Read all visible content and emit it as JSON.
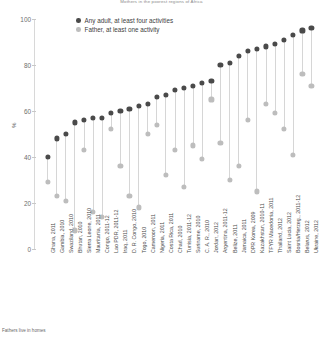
{
  "title": "Mothers in the poorest regions of Africa",
  "footnote": "Fathers live in homes",
  "legend": {
    "position": "top-left-inside",
    "items": [
      {
        "label": "Any adult, at least four activities",
        "color": "#4a4a4a",
        "key": "any_adult"
      },
      {
        "label": "Father, at least one activity",
        "color": "#bdbdbd",
        "key": "father"
      }
    ]
  },
  "chart_data": {
    "type": "scatter",
    "subtype": "lollipop-dumbbell",
    "title": "Mothers in the poorest regions of Africa",
    "xlabel": "",
    "ylabel": "%",
    "ylim": [
      0,
      100
    ],
    "yticks": [
      0,
      20,
      40,
      60,
      80,
      100
    ],
    "grid": false,
    "legend_position": "upper left",
    "categories": [
      "Ghana, 2011",
      "Gambia, 2010",
      "Swaziland, 2010",
      "Bhutan, 2010",
      "Sierra Leone, 2010",
      "Mauritania, 2011",
      "Congo, 2011-12",
      "Lao PDR, 2011-12",
      "Iraq, 2011",
      "D. R. Congo, 2010",
      "Togo, 2010",
      "Cameroon, 2011",
      "Nigeria, 2011",
      "Costa Rica, 2011",
      "Chad, 2010",
      "Tunisia, 2011-12",
      "Suriname, 2010",
      "C. A. R., 2010",
      "Jordan, 2012",
      "Argentina, 2011-12",
      "Belize, 2011",
      "Jamaica, 2011",
      "DPR Korea, 2009",
      "Kazakhstan, 2010-11",
      "TFYR Macedonia, 2011",
      "Thailand, 2012",
      "Saint Lucia, 2012",
      "Bosnia/Herzeg., 2011-12",
      "Belarus, 2012",
      "Ukraine, 2012"
    ],
    "series": [
      {
        "name": "Any adult, at least four activities",
        "key": "any_adult",
        "color": "#4a4a4a",
        "values": [
          40,
          48,
          50,
          55,
          56,
          57,
          57,
          59,
          60,
          61,
          62,
          63,
          66,
          67,
          69,
          70,
          71,
          72,
          73,
          80,
          81,
          84,
          86,
          87,
          88,
          89,
          91,
          93,
          95,
          96
        ]
      },
      {
        "name": "Father, at least one activity",
        "key": "father",
        "color": "#bdbdbd",
        "values": [
          29,
          23,
          21,
          8,
          43,
          16,
          14,
          52,
          36,
          23,
          18,
          50,
          54,
          32,
          43,
          27,
          45,
          39,
          65,
          46,
          30,
          36,
          56,
          25,
          63,
          59,
          52,
          41,
          76,
          71
        ]
      }
    ]
  }
}
